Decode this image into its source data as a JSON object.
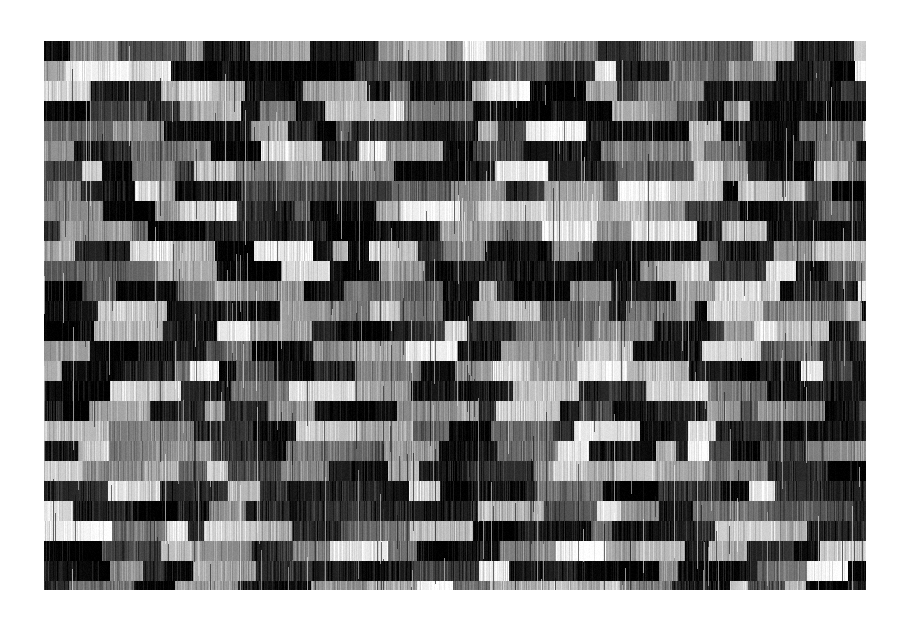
{
  "image": {
    "description": "Grayscale abstract texture of horizontal bands made of rectangular blocks with vertical streaks",
    "background": "#ffffff",
    "frame": {
      "x": 44,
      "y": 41,
      "width": 822,
      "height": 549
    },
    "texture": {
      "seed": 9113,
      "band_height": 20,
      "min_block_width": 12,
      "max_block_width": 70,
      "dark_probability": 0.42,
      "streak_density": 0.55,
      "palette": {
        "black": "#000000",
        "white": "#ffffff"
      }
    }
  }
}
